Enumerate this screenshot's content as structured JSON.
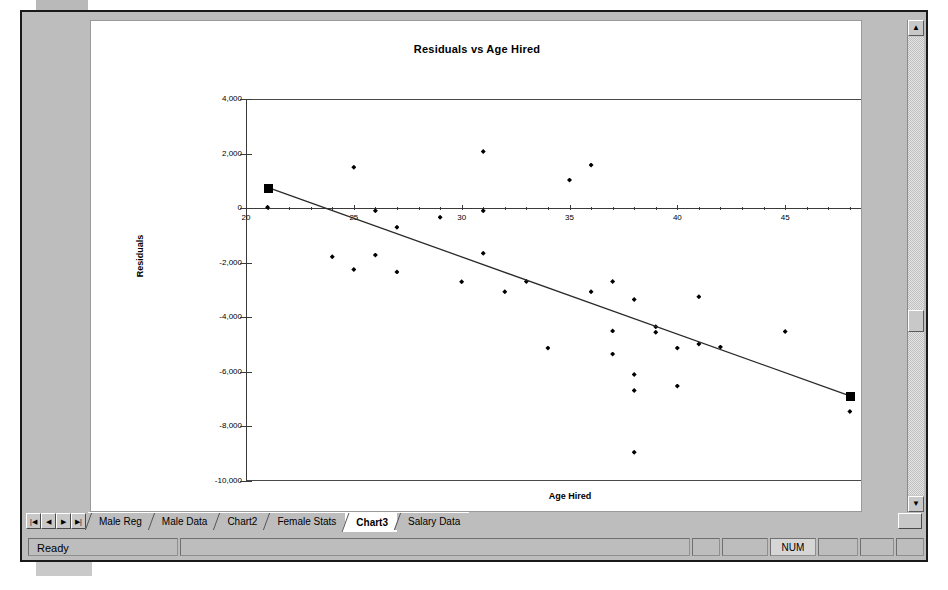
{
  "window": {
    "status_text": "Ready",
    "status_indicators": [
      "",
      "",
      "",
      "NUM",
      "",
      "",
      ""
    ],
    "num_indicator": "NUM"
  },
  "tab_nav": {
    "first_label": "|◀",
    "prev_label": "◀",
    "next_label": "▶",
    "last_label": "▶|"
  },
  "tabs": [
    {
      "label": "Male Reg",
      "active": false
    },
    {
      "label": "Male Data",
      "active": false
    },
    {
      "label": "Chart2",
      "active": false
    },
    {
      "label": "Female Stats",
      "active": false
    },
    {
      "label": "Chart3",
      "active": true
    },
    {
      "label": "Salary Data",
      "active": false
    }
  ],
  "scrollbar": {
    "up_arrow": "▲",
    "down_arrow": "▼",
    "right_arrow": "▶"
  },
  "chart_data": {
    "type": "scatter",
    "title": "Residuals vs Age Hired",
    "xlabel": "Age Hired",
    "ylabel": "Residuals",
    "xlim": [
      20,
      50
    ],
    "ylim": [
      -10000,
      4000
    ],
    "x_major_step": 5,
    "x_minor_step": 1,
    "y_step": 2000,
    "grid": false,
    "legend": false,
    "x_tick_labels": [
      "20",
      "25",
      "30",
      "35",
      "40",
      "45",
      "50"
    ],
    "y_tick_labels": [
      "4,000",
      "2,000",
      "0",
      "-2,000",
      "-4,000",
      "-6,000",
      "-8,000",
      "-10,000"
    ],
    "series": [
      {
        "name": "Residuals",
        "marker": "diamond",
        "points": [
          [
            21,
            30
          ],
          [
            25,
            1500
          ],
          [
            26,
            -100
          ],
          [
            29,
            -330
          ],
          [
            31,
            2080
          ],
          [
            31,
            -100
          ],
          [
            24,
            -1780
          ],
          [
            25,
            -2250
          ],
          [
            26,
            -1720
          ],
          [
            27,
            -2340
          ],
          [
            27,
            -700
          ],
          [
            30,
            -2700
          ],
          [
            31,
            -1650
          ],
          [
            32,
            -3060
          ],
          [
            33,
            -2690
          ],
          [
            34,
            -5130
          ],
          [
            35,
            1030
          ],
          [
            36,
            1580
          ],
          [
            36,
            -3060
          ],
          [
            37,
            -2690
          ],
          [
            37,
            -4500
          ],
          [
            37,
            -5350
          ],
          [
            38,
            -3350
          ],
          [
            38,
            -6100
          ],
          [
            38,
            -6680
          ],
          [
            38,
            -8950
          ],
          [
            39,
            -4350
          ],
          [
            39,
            -4550
          ],
          [
            40,
            -5130
          ],
          [
            40,
            -6520
          ],
          [
            41,
            -3250
          ],
          [
            41,
            -4980
          ],
          [
            42,
            -5090
          ],
          [
            45,
            -4520
          ],
          [
            48,
            -7450
          ]
        ]
      },
      {
        "name": "Predicted residual trend line",
        "type": "line",
        "endpoints": [
          [
            21,
            760
          ],
          [
            48,
            -6880
          ]
        ],
        "handles": [
          [
            21,
            760
          ],
          [
            48,
            -6880
          ]
        ]
      }
    ]
  }
}
